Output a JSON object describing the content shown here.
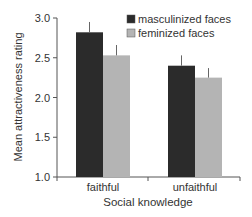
{
  "chart_data": {
    "type": "bar",
    "title": "",
    "xlabel": "Social knowledge",
    "ylabel": "Mean attractiveness rating",
    "ylim": [
      1.0,
      3.0
    ],
    "yticks": [
      "1.0",
      "1.5",
      "2.0",
      "2.5",
      "3.0"
    ],
    "categories": [
      "faithful",
      "unfaithful"
    ],
    "series": [
      {
        "name": "masculinized faces",
        "color": "#2b2b2b",
        "values": [
          2.82,
          2.4
        ],
        "error_upper": [
          2.95,
          2.53
        ]
      },
      {
        "name": "feminized faces",
        "color": "#b4b4b4",
        "values": [
          2.53,
          2.25
        ],
        "error_upper": [
          2.66,
          2.37
        ]
      }
    ],
    "grid": false,
    "legend_position": "upper right"
  }
}
